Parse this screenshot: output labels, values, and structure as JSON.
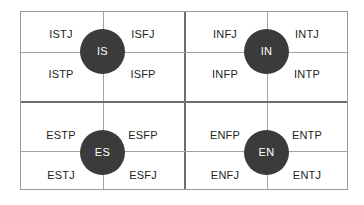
{
  "diagram": {
    "colors": {
      "hub_fill": "#3b3b3b",
      "hub_text": "#ffffff",
      "grid_line": "#a3a3a3",
      "grid_line_major": "#6e6e6e",
      "cell_text": "#231f20",
      "background": "#ffffff"
    },
    "hubs": [
      {
        "label": "IS",
        "x": 102,
        "y": 51
      },
      {
        "label": "IN",
        "x": 266,
        "y": 51
      },
      {
        "label": "ES",
        "x": 102,
        "y": 152
      },
      {
        "label": "EN",
        "x": 266,
        "y": 152
      }
    ],
    "cells": [
      {
        "label": "ISTJ",
        "x": 20,
        "y": 28
      },
      {
        "label": "ISFJ",
        "x": 102,
        "y": 28
      },
      {
        "label": "INFJ",
        "x": 184,
        "y": 28
      },
      {
        "label": "INTJ",
        "x": 266,
        "y": 28
      },
      {
        "label": "ISTP",
        "x": 20,
        "y": 68
      },
      {
        "label": "ISFP",
        "x": 102,
        "y": 68
      },
      {
        "label": "INFP",
        "x": 184,
        "y": 68
      },
      {
        "label": "INTP",
        "x": 266,
        "y": 68
      },
      {
        "label": "ESTP",
        "x": 20,
        "y": 129
      },
      {
        "label": "ESFP",
        "x": 102,
        "y": 129
      },
      {
        "label": "ENFP",
        "x": 184,
        "y": 129
      },
      {
        "label": "ENTP",
        "x": 266,
        "y": 129
      },
      {
        "label": "ESTJ",
        "x": 20,
        "y": 169
      },
      {
        "label": "ESFJ",
        "x": 102,
        "y": 169
      },
      {
        "label": "ENFJ",
        "x": 184,
        "y": 169
      },
      {
        "label": "ENTJ",
        "x": 266,
        "y": 169
      }
    ],
    "gridlines": {
      "vertical": [
        {
          "x": 82,
          "major": false
        },
        {
          "x": 164,
          "major": true
        },
        {
          "x": 246,
          "major": false
        }
      ],
      "horizontal": [
        {
          "y": 40,
          "major": false
        },
        {
          "y": 89,
          "major": true
        },
        {
          "y": 140,
          "major": false
        }
      ]
    }
  }
}
